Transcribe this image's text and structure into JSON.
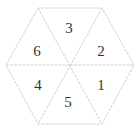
{
  "diagram": {
    "type": "hexagon-divided-into-six-triangles",
    "edge_color": "#cfcfcf",
    "label_color": "#333333",
    "regions": [
      {
        "position": "right-upper",
        "label": "2"
      },
      {
        "position": "top",
        "label": "3"
      },
      {
        "position": "left-upper",
        "label": "6"
      },
      {
        "position": "left-lower",
        "label": "4"
      },
      {
        "position": "bottom",
        "label": "5"
      },
      {
        "position": "right-lower",
        "label": "1"
      }
    ]
  }
}
